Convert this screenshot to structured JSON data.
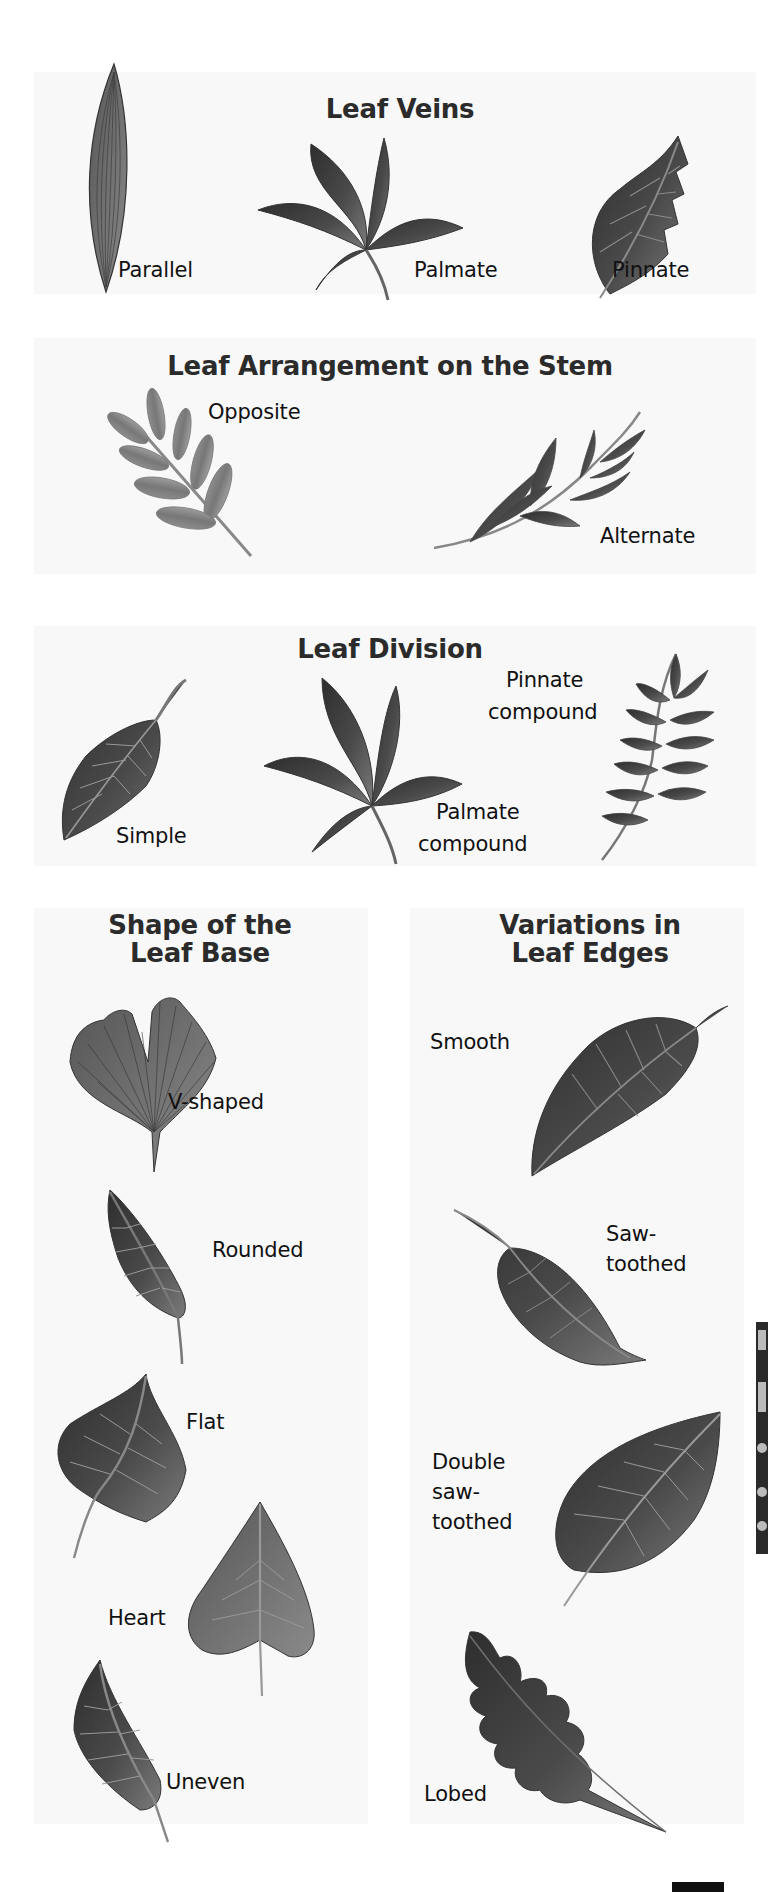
{
  "sections": {
    "veins": {
      "title": "Leaf Veins",
      "labels": [
        "Parallel",
        "Palmate",
        "Pinnate"
      ]
    },
    "arrangement": {
      "title": "Leaf Arrangement on the Stem",
      "labels": [
        "Opposite",
        "Alternate"
      ]
    },
    "division": {
      "title": "Leaf Division",
      "labels": {
        "simple": "Simple",
        "palmate_compound_1": "Palmate",
        "palmate_compound_2": "compound",
        "pinnate_compound_1": "Pinnate",
        "pinnate_compound_2": "compound"
      }
    },
    "base": {
      "title_line1": "Shape of the",
      "title_line2": "Leaf Base",
      "labels": [
        "V-shaped",
        "Rounded",
        "Flat",
        "Heart",
        "Uneven"
      ]
    },
    "edges": {
      "title_line1": "Variations in",
      "title_line2": "Leaf Edges",
      "labels": {
        "smooth": "Smooth",
        "saw_1": "Saw-",
        "saw_2": "toothed",
        "double_1": "Double",
        "double_2": "saw-",
        "double_3": "toothed",
        "lobed": "Lobed"
      }
    }
  },
  "icons": [
    "leaf-parallel-icon",
    "leaf-palmate-icon",
    "leaf-pinnate-icon",
    "branch-opposite-icon",
    "branch-alternate-icon",
    "leaf-simple-icon",
    "leaf-palmate-compound-icon",
    "leaf-pinnate-compound-icon",
    "leaf-v-shaped-icon",
    "leaf-rounded-icon",
    "leaf-flat-icon",
    "leaf-heart-icon",
    "leaf-uneven-icon",
    "leaf-smooth-icon",
    "leaf-saw-toothed-icon",
    "leaf-double-saw-toothed-icon",
    "leaf-lobed-icon"
  ],
  "colors": {
    "panel_bg": "#f8f8f8",
    "leaf_dark": "#3a3a3a",
    "leaf_mid": "#6a6a6a",
    "leaf_light": "#9a9a9a",
    "title": "#2b2b2b"
  }
}
